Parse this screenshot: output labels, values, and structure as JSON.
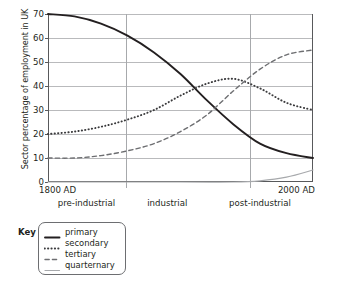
{
  "chart_data": {
    "type": "line",
    "title": "",
    "xlabel": "",
    "ylabel": "Sector percentage of employment in UK",
    "ylim": [
      0,
      70
    ],
    "ytick_labels": [
      "0",
      "10",
      "20",
      "30",
      "40",
      "50",
      "60",
      "70"
    ],
    "ytick_values": [
      0,
      10,
      20,
      30,
      40,
      50,
      60,
      70
    ],
    "grid": true,
    "x_start_label": "1800 AD",
    "x_end_label": "2000 AD",
    "xlim_labels": [
      "1800 AD",
      "2000 AD"
    ],
    "eras": [
      {
        "label": "pre-industrial",
        "center_fraction": 0.145
      },
      {
        "label": "industrial",
        "center_fraction": 0.45
      },
      {
        "label": "post-industrial",
        "center_fraction": 0.8
      }
    ],
    "era_divider_fractions": [
      0.294,
      0.762
    ],
    "legend_position": "below-left",
    "legend_title": "Key",
    "series": [
      {
        "name": "primary",
        "style": "solid",
        "color": "#231f20",
        "x": [
          1800,
          1820,
          1840,
          1860,
          1880,
          1900,
          1920,
          1940,
          1960,
          1980,
          2000
        ],
        "values": [
          70,
          69,
          66,
          61,
          54,
          45,
          34,
          24,
          16,
          12,
          10
        ]
      },
      {
        "name": "secondary",
        "style": "dotted",
        "color": "#3b3b3d",
        "x": [
          1800,
          1820,
          1840,
          1860,
          1880,
          1900,
          1920,
          1940,
          1960,
          1980,
          2000
        ],
        "values": [
          20,
          21,
          23,
          26,
          30,
          36,
          41,
          43,
          39,
          33,
          30
        ]
      },
      {
        "name": "tertiary",
        "style": "dashed",
        "color": "#6d6e71",
        "x": [
          1800,
          1820,
          1840,
          1860,
          1880,
          1900,
          1920,
          1940,
          1960,
          1980,
          2000
        ],
        "values": [
          10,
          10,
          11,
          13,
          16,
          21,
          28,
          38,
          47,
          53,
          55
        ]
      },
      {
        "name": "quarternary",
        "style": "solid-light",
        "color": "#a7a9ac",
        "x": [
          1800,
          1900,
          1940,
          1960,
          1980,
          2000
        ],
        "values": [
          0,
          0,
          0,
          0.5,
          2,
          5
        ]
      }
    ]
  },
  "legend": {
    "title": "Key",
    "entries": [
      {
        "label": "primary",
        "style": "solid",
        "color": "#231f20"
      },
      {
        "label": "secondary",
        "style": "dotted",
        "color": "#3b3b3d"
      },
      {
        "label": "tertiary",
        "style": "dashed",
        "color": "#6d6e71"
      },
      {
        "label": "quarternary",
        "style": "solid-light",
        "color": "#a7a9ac"
      }
    ]
  }
}
